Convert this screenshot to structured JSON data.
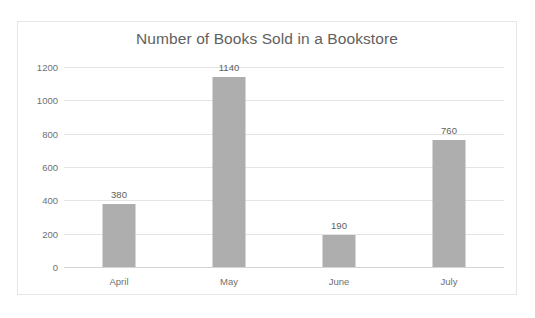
{
  "chart_data": {
    "type": "bar",
    "title": "Number of Books Sold in a Bookstore",
    "categories": [
      "April",
      "May",
      "June",
      "July"
    ],
    "values": [
      380,
      1140,
      190,
      760
    ],
    "data_labels": [
      "380",
      "1140",
      "190",
      "760"
    ],
    "xlabel": "",
    "ylabel": "",
    "ylim": [
      0,
      1200
    ],
    "yticks": [
      0,
      200,
      400,
      600,
      800,
      1000,
      1200
    ],
    "ytick_labels": [
      "0",
      "200",
      "400",
      "600",
      "800",
      "1000",
      "1200"
    ],
    "grid": true,
    "legend": false,
    "series": [
      {
        "name": "Books Sold",
        "values": [
          380,
          1140,
          190,
          760
        ]
      }
    ],
    "colors": {
      "bar": "#aeaeae",
      "gridline": "#e4e4e4",
      "baseline": "#d4d4d4",
      "title_text": "#616161",
      "tick_text": "#6f6f6f",
      "label_text": "#5e5e5e",
      "frame_border": "#e6e6e6",
      "background": "#ffffff"
    }
  }
}
